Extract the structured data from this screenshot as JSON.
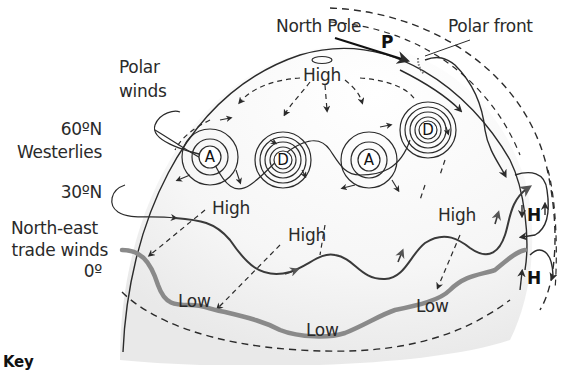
{
  "diagram": {
    "left_labels": {
      "polar_winds": [
        "Polar",
        "winds"
      ],
      "lat_60": "60ºN",
      "westerlies": "Westerlies",
      "lat_30": "30ºN",
      "ne_trade": [
        "North-east",
        "trade winds"
      ],
      "lat_0": "0º"
    },
    "top_labels": {
      "north_pole": "North Pole",
      "polar_front": "Polar front",
      "p_marker": "P"
    },
    "pressure_labels": {
      "polar_high": "High",
      "subtropical_high_1": "High",
      "subtropical_high_2": "High",
      "subtropical_high_3": "High",
      "equatorial_low_1": "Low",
      "equatorial_low_2": "Low",
      "equatorial_low_3": "Low"
    },
    "systems": [
      {
        "type": "anticyclone",
        "letter": "A"
      },
      {
        "type": "depression",
        "letter": "D"
      },
      {
        "type": "anticyclone",
        "letter": "A"
      },
      {
        "type": "depression",
        "letter": "D"
      }
    ],
    "hadley_cells": [
      "H",
      "H"
    ],
    "key_label": "Key"
  },
  "colors": {
    "line": "#2b2b2b",
    "jet_stream": "#444444",
    "itcz": "#8a8a8a",
    "globe_shade": "#f1f1f1"
  }
}
